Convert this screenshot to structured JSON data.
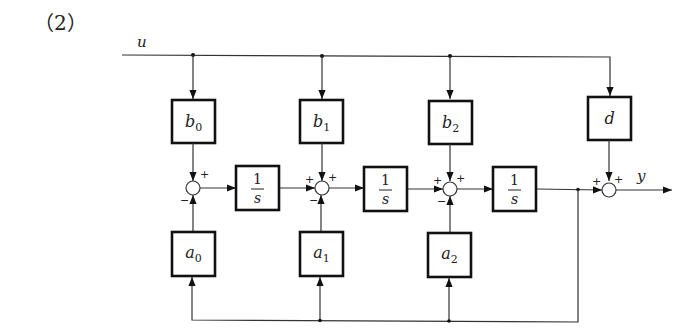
{
  "problem_label": "（2）",
  "signals": {
    "input": "u",
    "output": "y"
  },
  "feedforward_blocks": [
    {
      "name": "b",
      "sub": "0"
    },
    {
      "name": "b",
      "sub": "1"
    },
    {
      "name": "b",
      "sub": "2"
    },
    {
      "name": "d",
      "sub": ""
    }
  ],
  "integrator_blocks": [
    {
      "num": "1",
      "den": "s"
    },
    {
      "num": "1",
      "den": "s"
    },
    {
      "num": "1",
      "den": "s"
    }
  ],
  "feedback_blocks": [
    {
      "name": "a",
      "sub": "0"
    },
    {
      "name": "a",
      "sub": "1"
    },
    {
      "name": "a",
      "sub": "2"
    }
  ],
  "summing_junctions": [
    {
      "top_sign": "+",
      "left_sign": "",
      "bottom_sign": "−"
    },
    {
      "top_sign": "+",
      "left_sign": "+",
      "bottom_sign": "−"
    },
    {
      "top_sign": "+",
      "left_sign": "+",
      "bottom_sign": "−"
    },
    {
      "top_sign": "+",
      "left_sign": "+",
      "bottom_sign": ""
    }
  ]
}
